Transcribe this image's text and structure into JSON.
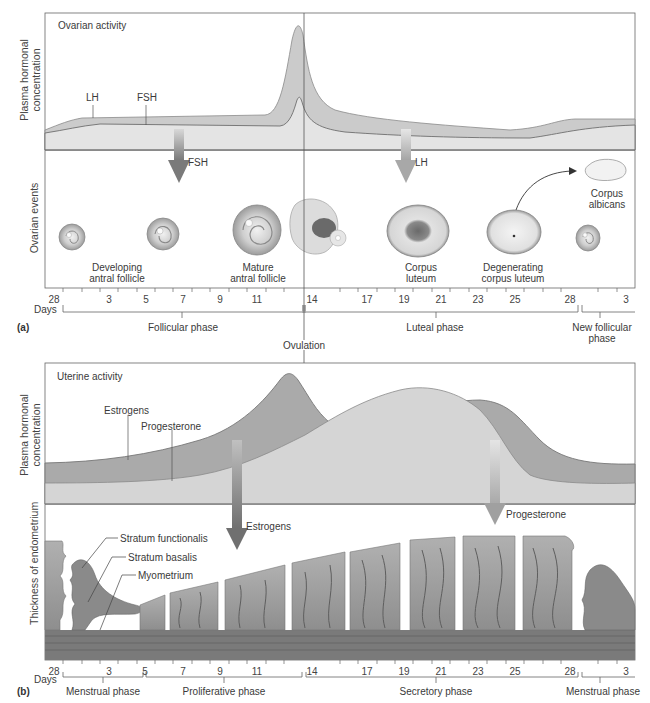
{
  "figure": {
    "panel_a": {
      "tag": "(a)",
      "hormone_chart": {
        "title": "Ovarian activity",
        "y_axis_label_line1": "Plasma hormonal",
        "y_axis_label_line2": "concentration",
        "series_labels": {
          "lh": "LH",
          "fsh": "FSH"
        },
        "arrows": {
          "fsh": "FSH",
          "lh": "LH"
        }
      },
      "ovarian_events": {
        "y_axis_label": "Ovarian events",
        "stages": [
          {
            "line1": "Developing",
            "line2": "antral follicle"
          },
          {
            "line1": "Mature",
            "line2": "antral follicle"
          },
          {
            "line1": "Corpus",
            "line2": "luteum"
          },
          {
            "line1": "Degenerating",
            "line2": "corpus luteum"
          },
          {
            "line1": "Corpus",
            "line2": "albicans"
          }
        ]
      },
      "days_label": "Days",
      "day_ticks": [
        "28",
        "3",
        "5",
        "7",
        "9",
        "11",
        "14",
        "17",
        "19",
        "21",
        "23",
        "25",
        "28",
        "3"
      ],
      "phases": [
        {
          "line1": "Follicular phase",
          "line2": ""
        },
        {
          "line1": "Luteal phase",
          "line2": ""
        },
        {
          "line1": "New follicular",
          "line2": "phase"
        }
      ]
    },
    "ovulation_label": "Ovulation",
    "panel_b": {
      "tag": "(b)",
      "hormone_chart": {
        "title": "Uterine activity",
        "y_axis_label_line1": "Plasma hormonal",
        "y_axis_label_line2": "concentration",
        "series_labels": {
          "estrogens": "Estrogens",
          "progesterone": "Progesterone"
        },
        "arrows": {
          "estrogens": "Estrogens",
          "progesterone": "Progesterone"
        }
      },
      "endometrium": {
        "y_axis_label": "Thickness of endometrium",
        "layer_labels": [
          "Stratum functionalis",
          "Stratum basalis",
          "Myometrium"
        ]
      },
      "days_label": "Days",
      "day_ticks": [
        "28",
        "3",
        "5",
        "7",
        "9",
        "11",
        "14",
        "17",
        "19",
        "21",
        "23",
        "25",
        "28",
        "3"
      ],
      "phases": [
        "Menstrual phase",
        "Proliferative phase",
        "Secretory phase",
        "Menstrual phase"
      ]
    },
    "colors": {
      "lh_fill": "#c9c9c9",
      "fsh_fill": "#e2e2e2",
      "line": "#6e6e6e",
      "estrogen_fill": "#a9a9a9",
      "progesterone_fill": "#d4d4d4",
      "tissue": "#9a9a9a",
      "frame": "#555555"
    }
  }
}
